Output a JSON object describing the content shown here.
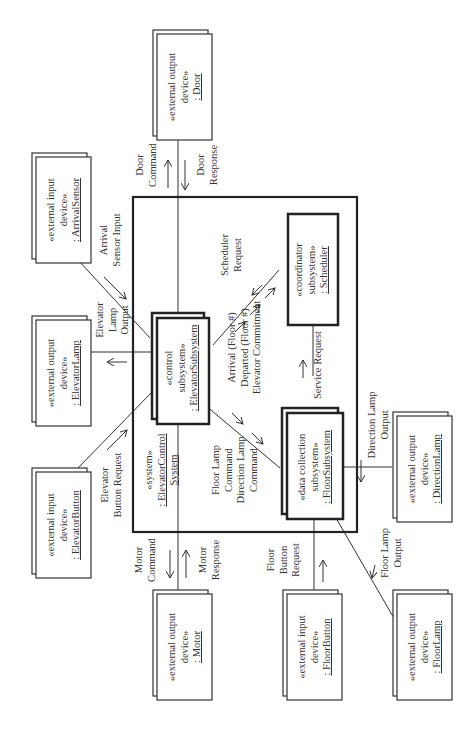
{
  "diagram": {
    "system": {
      "stereotype": "«system»",
      "name_line1": ": ElevatorControl",
      "name_line2": "System"
    },
    "subsystems": {
      "elevator": {
        "stereotype_line1": "«control",
        "stereotype_line2": "subsystem»",
        "name": ": ElevatorSubsystem"
      },
      "scheduler": {
        "stereotype_line1": "«coordinator",
        "stereotype_line2": "subsystem»",
        "name": ": Scheduler"
      },
      "floor": {
        "stereotype_line1": "«data collection",
        "stereotype_line2": "subsystem»",
        "name": ": FloorSubsystem"
      }
    },
    "devices": {
      "door": {
        "line1": "«external output",
        "line2": "device»",
        "name": ": Door"
      },
      "arrival_sensor": {
        "line1": "«external input",
        "line2": "device»",
        "name": ": ArrivalSensor"
      },
      "elevator_lamp": {
        "line1": "«external output",
        "line2": "device»",
        "name": ": ElevatorLamp"
      },
      "elevator_button": {
        "line1": "«external input",
        "line2": "device»",
        "name": ": ElevatorButton"
      },
      "motor": {
        "line1": "«external output",
        "line2": "device»",
        "name": ": Motor"
      },
      "floor_button": {
        "line1": "«external input",
        "line2": "device»",
        "name": ": FloorButton"
      },
      "floor_lamp": {
        "line1": "«external output",
        "line2": "device»",
        "name": ": FloorLamp"
      },
      "direction_lamp": {
        "line1": "«external output",
        "line2": "device»",
        "name": ": DirectionLamp"
      }
    },
    "messages": {
      "door_command": [
        "Door",
        "Command"
      ],
      "door_response": [
        "Door",
        "Response"
      ],
      "arrival_sensor_input": [
        "Arrival",
        "Sensor Input"
      ],
      "elevator_lamp_output": [
        "Elevator",
        "Lamp",
        "Output"
      ],
      "elevator_button_request": [
        "Elevator",
        "Button Request"
      ],
      "motor_command": [
        "Motor",
        "Command"
      ],
      "motor_response": [
        "Motor",
        "Response"
      ],
      "scheduler_request": [
        "Scheduler",
        "Request"
      ],
      "arrival_departed_commitment": [
        "Arrival (Floor #)",
        "Departed (Floor #)",
        "Elevator Commitment"
      ],
      "lamp_commands": [
        "Floor Lamp",
        "Command",
        "Direction Lamp",
        "Command"
      ],
      "service_request": [
        "Service Request"
      ],
      "direction_lamp_output": [
        "Direction Lamp",
        "Output"
      ],
      "floor_button_request": [
        "Floor",
        "Button",
        "Request"
      ],
      "floor_lamp_output": [
        "Floor Lamp",
        "Output"
      ]
    }
  }
}
